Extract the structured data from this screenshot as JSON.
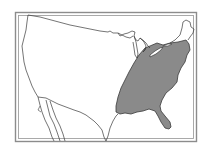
{
  "map": {
    "title": "Contiguous United States — eastern region highlighted",
    "subject": "United States outline map",
    "highlighted_region": "Eastern United States",
    "colors": {
      "background": "#ffffff",
      "frame": "#8c8c8c",
      "outline": "#3a3a3a",
      "highlight_fill": "#8a8a8a",
      "land_fill": "#ffffff"
    },
    "features": [
      "double-line frame",
      "state/border outlines",
      "Great Lakes",
      "Florida peninsula",
      "shaded eastern region"
    ]
  }
}
